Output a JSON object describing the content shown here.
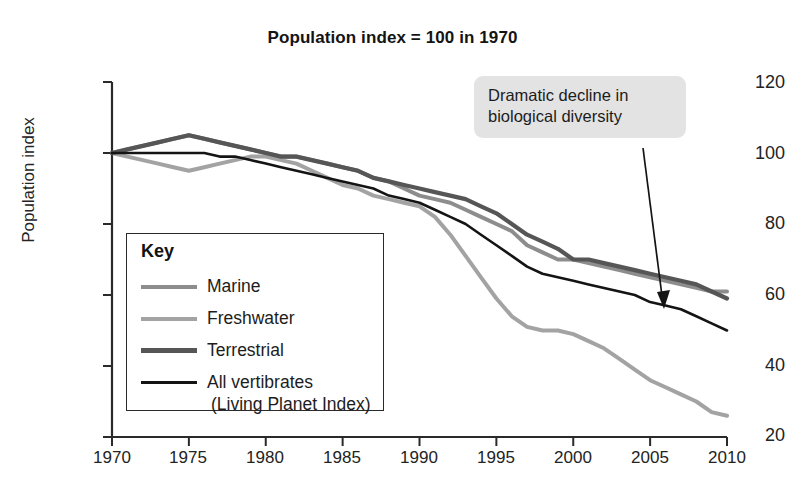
{
  "chart_data": {
    "type": "line",
    "title": "Population index = 100 in 1970",
    "xlabel": "",
    "ylabel": "Population index",
    "xlim": [
      1970,
      2010
    ],
    "ylim": [
      20,
      120
    ],
    "xticks": [
      1970,
      1975,
      1980,
      1985,
      1990,
      1995,
      2000,
      2005,
      2010
    ],
    "yticks": [
      20,
      40,
      60,
      80,
      100,
      120
    ],
    "grid": false,
    "legend_position": "inside-lower-left",
    "legend_title": "Key",
    "x": [
      1970,
      1971,
      1972,
      1973,
      1974,
      1975,
      1976,
      1977,
      1978,
      1979,
      1980,
      1981,
      1982,
      1983,
      1984,
      1985,
      1986,
      1987,
      1988,
      1989,
      1990,
      1991,
      1992,
      1993,
      1994,
      1995,
      1996,
      1997,
      1998,
      1999,
      2000,
      2001,
      2002,
      2003,
      2004,
      2005,
      2006,
      2007,
      2008,
      2009,
      2010
    ],
    "series": [
      {
        "name": "Marine",
        "color": "#8d8d8d",
        "width": 4.0,
        "values": [
          100,
          101,
          102,
          103,
          104,
          105,
          104,
          103,
          102,
          101,
          100,
          99,
          99,
          98,
          97,
          96,
          95,
          93,
          92,
          90,
          88,
          87,
          86,
          84,
          82,
          80,
          78,
          74,
          72,
          70,
          70,
          69,
          68,
          67,
          66,
          65,
          64,
          63,
          62,
          61,
          61
        ]
      },
      {
        "name": "Freshwater",
        "color": "#a3a3a3",
        "width": 4.0,
        "values": [
          100,
          99,
          98,
          97,
          96,
          95,
          96,
          97,
          98,
          99,
          99,
          98,
          97,
          95,
          93,
          91,
          90,
          88,
          87,
          86,
          85,
          82,
          77,
          71,
          65,
          59,
          54,
          51,
          50,
          50,
          49,
          47,
          45,
          42,
          39,
          36,
          34,
          32,
          30,
          27,
          26
        ]
      },
      {
        "name": "Terrestrial",
        "color": "#565656",
        "width": 4.2,
        "values": [
          100,
          101,
          102,
          103,
          104,
          105,
          104,
          103,
          102,
          101,
          100,
          99,
          99,
          98,
          97,
          96,
          95,
          93,
          92,
          91,
          90,
          89,
          88,
          87,
          85,
          83,
          80,
          77,
          75,
          73,
          70,
          70,
          69,
          68,
          67,
          66,
          65,
          64,
          63,
          61,
          59
        ]
      },
      {
        "name": "All vertibrates (Living Planet Index)",
        "color": "#141414",
        "width": 2.6,
        "values": [
          100,
          100,
          100,
          100,
          100,
          100,
          100,
          99,
          99,
          98,
          97,
          96,
          95,
          94,
          93,
          92,
          91,
          90,
          88,
          87,
          86,
          84,
          82,
          80,
          77,
          74,
          71,
          68,
          66,
          65,
          64,
          63,
          62,
          61,
          60,
          58,
          57,
          56,
          54,
          52,
          50
        ]
      }
    ],
    "annotations": [
      {
        "name": "dramatic-decline-callout",
        "text_line1": "Dramatic decline in",
        "text_line2": "biological diversity",
        "background": "#e3e3e3",
        "arrow_from": [
          643,
          148
        ],
        "arrow_to": [
          664,
          308
        ]
      }
    ]
  },
  "legend": {
    "title": "Key",
    "items": [
      {
        "label": "Marine",
        "sub": ""
      },
      {
        "label": "Freshwater",
        "sub": ""
      },
      {
        "label": "Terrestrial",
        "sub": ""
      },
      {
        "label": "All vertibrates",
        "sub": "(Living Planet Index)"
      }
    ]
  },
  "axes": {
    "y_title": "Population index",
    "y_labels": [
      "120",
      "100",
      "80",
      "60",
      "40",
      "20"
    ],
    "x_labels": [
      "1970",
      "1975",
      "1980",
      "1985",
      "1990",
      "1995",
      "2000",
      "2005",
      "2010"
    ]
  },
  "annotation": {
    "line1": "Dramatic decline in",
    "line2": "biological diversity"
  },
  "colors": {
    "marine": "#8d8d8d",
    "freshwater": "#a3a3a3",
    "terrestrial": "#565656",
    "all_vertibrates": "#141414",
    "axis": "#2a2a2a",
    "callout_bg": "#e3e3e3"
  }
}
